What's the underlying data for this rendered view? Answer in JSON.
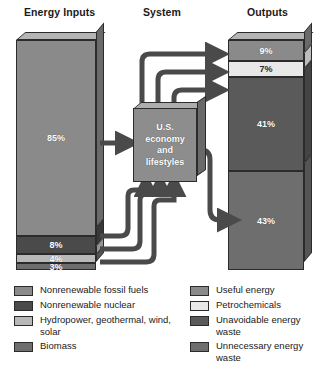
{
  "headings": {
    "inputs": "Energy Inputs",
    "system": "System",
    "outputs": "Outputs"
  },
  "system": {
    "label": "U.S.\neconomy\nand\nlifestyles"
  },
  "chart_data": {
    "type": "bar",
    "subtitle": "",
    "xlabel": "",
    "ylabel": "",
    "grid": false,
    "legend_position": "bottom",
    "series": [
      {
        "name": "Energy Inputs",
        "categories": [
          "Nonrenewable fossil fuels",
          "Nonrenewable nuclear",
          "Hydropower, geothermal, wind, solar",
          "Biomass"
        ],
        "values": [
          85,
          8,
          4,
          3
        ],
        "labels": [
          "85%",
          "8%",
          "4%",
          "3%"
        ],
        "colors": [
          "#8a8a8a",
          "#4a4a4a",
          "#b8b8b8",
          "#6e6e6e"
        ]
      },
      {
        "name": "Outputs",
        "categories": [
          "Useful energy",
          "Petrochemicals",
          "Unavoidable energy waste",
          "Unnecessary energy waste"
        ],
        "values": [
          9,
          7,
          41,
          43
        ],
        "labels": [
          "9%",
          "7%",
          "41%",
          "43%"
        ],
        "colors": [
          "#8a8a8a",
          "#e8e8e8",
          "#5a5a5a",
          "#6e6e6e"
        ]
      }
    ]
  },
  "input_bar": {
    "segments": [
      {
        "label": "85%",
        "value": 85,
        "color": "#8a8a8a",
        "side": "#6a6a6a",
        "dark_label": false
      },
      {
        "label": "8%",
        "value": 8,
        "color": "#4a4a4a",
        "side": "#383838",
        "dark_label": false
      },
      {
        "label": "4%",
        "value": 4,
        "color": "#b8b8b8",
        "side": "#949494",
        "dark_label": false
      },
      {
        "label": "3%",
        "value": 3,
        "color": "#6e6e6e",
        "side": "#555555",
        "dark_label": false
      }
    ]
  },
  "output_bar": {
    "segments": [
      {
        "label": "9%",
        "value": 9,
        "color": "#8a8a8a",
        "side": "#6a6a6a",
        "dark_label": false
      },
      {
        "label": "7%",
        "value": 7,
        "color": "#e8e8e8",
        "side": "#bdbdbd",
        "dark_label": true
      },
      {
        "label": "41%",
        "value": 41,
        "color": "#5a5a5a",
        "side": "#444444",
        "dark_label": false
      },
      {
        "label": "43%",
        "value": 43,
        "color": "#6e6e6e",
        "side": "#555555",
        "dark_label": false
      }
    ]
  },
  "legend_left": [
    {
      "label": "Nonrenewable fossil fuels",
      "color": "#8a8a8a"
    },
    {
      "label": "Nonrenewable nuclear",
      "color": "#4a4a4a"
    },
    {
      "label": "Hydropower, geothermal, wind, solar",
      "color": "#b8b8b8"
    },
    {
      "label": "Biomass",
      "color": "#6e6e6e"
    }
  ],
  "legend_right": [
    {
      "label": "Useful energy",
      "color": "#8a8a8a"
    },
    {
      "label": "Petrochemicals",
      "color": "#e8e8e8"
    },
    {
      "label": "Unavoidable energy waste",
      "color": "#5a5a5a"
    },
    {
      "label": "Unnecessary energy waste",
      "color": "#6e6e6e"
    }
  ],
  "arrow_color": "#4a4a4a"
}
